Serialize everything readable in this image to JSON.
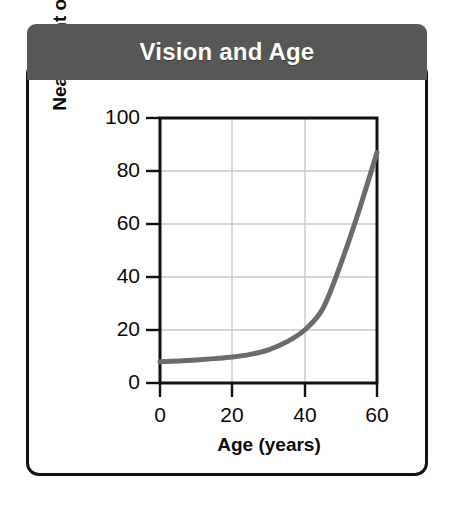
{
  "panel": {
    "title": "Vision and Age",
    "title_bar_color": "#575757",
    "border_color": "#111111",
    "background_color": "#ffffff"
  },
  "chart_data": {
    "type": "line",
    "title": "Vision and Age",
    "xlabel": "Age (years)",
    "ylabel": "Near Point of Vision (cm)",
    "xlim": [
      0,
      60
    ],
    "ylim": [
      0,
      100
    ],
    "xticks": [
      0,
      20,
      40,
      60
    ],
    "yticks": [
      0,
      20,
      40,
      60,
      80,
      100
    ],
    "xtick_labels": [
      "0",
      "20",
      "40",
      "60"
    ],
    "ytick_labels": [
      "0",
      "20",
      "40",
      "60",
      "80",
      "100"
    ],
    "grid": true,
    "grid_color": "#c8c8c8",
    "legend": null,
    "line_color": "#6b6b6b",
    "line_width": 5,
    "series": [
      {
        "name": "Near point of vision",
        "x": [
          0,
          5,
          10,
          15,
          20,
          25,
          30,
          35,
          40,
          45,
          50,
          55,
          60
        ],
        "values": [
          8,
          8.3,
          8.7,
          9.2,
          9.8,
          10.8,
          12.5,
          15.5,
          20,
          28,
          45,
          65,
          87
        ]
      }
    ]
  }
}
